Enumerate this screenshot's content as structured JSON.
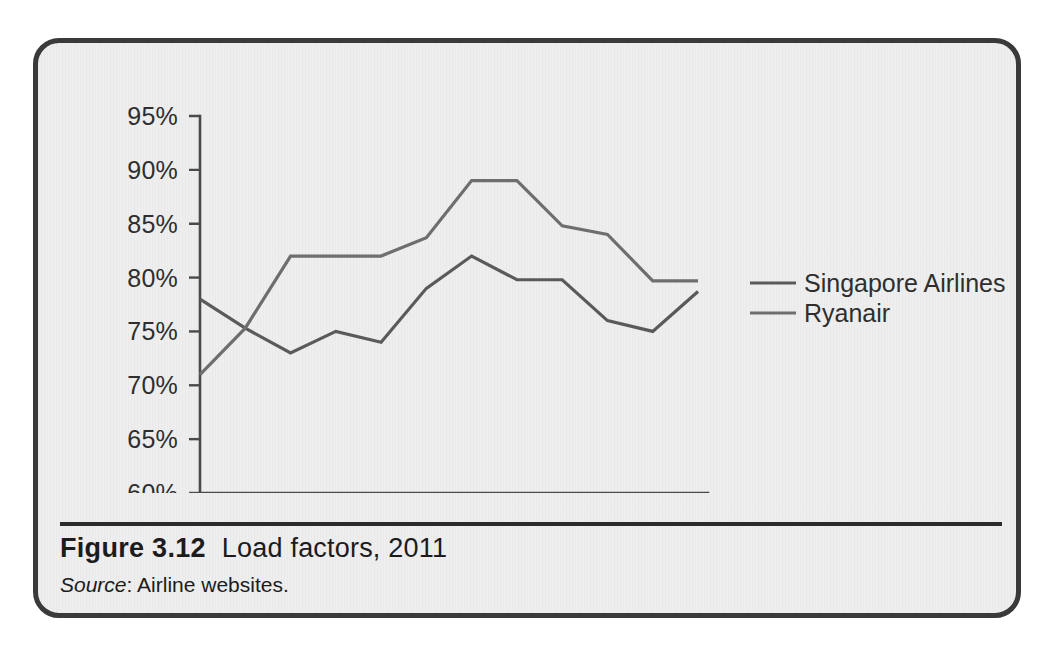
{
  "figure": {
    "number": "Figure 3.12",
    "title": "Load factors, 2011",
    "source_label": "Source",
    "source_text": ": Airline websites."
  },
  "legend": {
    "position": "right",
    "entries": [
      {
        "label": "Singapore Airlines",
        "color": "#5a5a5a"
      },
      {
        "label": "Ryanair",
        "color": "#6e6e6e"
      }
    ]
  },
  "axes": {
    "y_ticks": [
      "60%",
      "65%",
      "70%",
      "75%",
      "80%",
      "85%",
      "90%",
      "95%"
    ],
    "x_ticks": [
      "Jan",
      "Feb",
      "Mar",
      "Apr",
      "May",
      "Jun",
      "Jul",
      "Aug",
      "Sep",
      "Oct",
      "Nov",
      "Dec"
    ]
  },
  "colors": {
    "frame_border": "#3a3a3a",
    "panel_background": "#eeeeee",
    "axis": "#4a4a4a",
    "text": "#2e2e2e",
    "caption_rule": "#2b2b2b"
  },
  "chart_data": {
    "type": "line",
    "title": "Load factors, 2011",
    "xlabel": "",
    "ylabel": "",
    "ylim": [
      60,
      95
    ],
    "ytick_values": [
      60,
      65,
      70,
      75,
      80,
      85,
      90,
      95
    ],
    "ytick_format": "percent",
    "grid": false,
    "legend_position": "right",
    "categories": [
      "Jan",
      "Feb",
      "Mar",
      "Apr",
      "May",
      "Jun",
      "Jul",
      "Aug",
      "Sep",
      "Oct",
      "Nov",
      "Dec"
    ],
    "series": [
      {
        "name": "Singapore Airlines",
        "color": "#5a5a5a",
        "values": [
          78.0,
          75.3,
          73.0,
          75.0,
          74.0,
          79.0,
          82.0,
          79.8,
          79.8,
          76.0,
          75.0,
          78.7
        ]
      },
      {
        "name": "Ryanair",
        "color": "#6e6e6e",
        "values": [
          71.0,
          75.3,
          82.0,
          82.0,
          82.0,
          83.7,
          89.0,
          89.0,
          84.8,
          84.0,
          79.7,
          79.7
        ]
      }
    ],
    "annotations": []
  }
}
